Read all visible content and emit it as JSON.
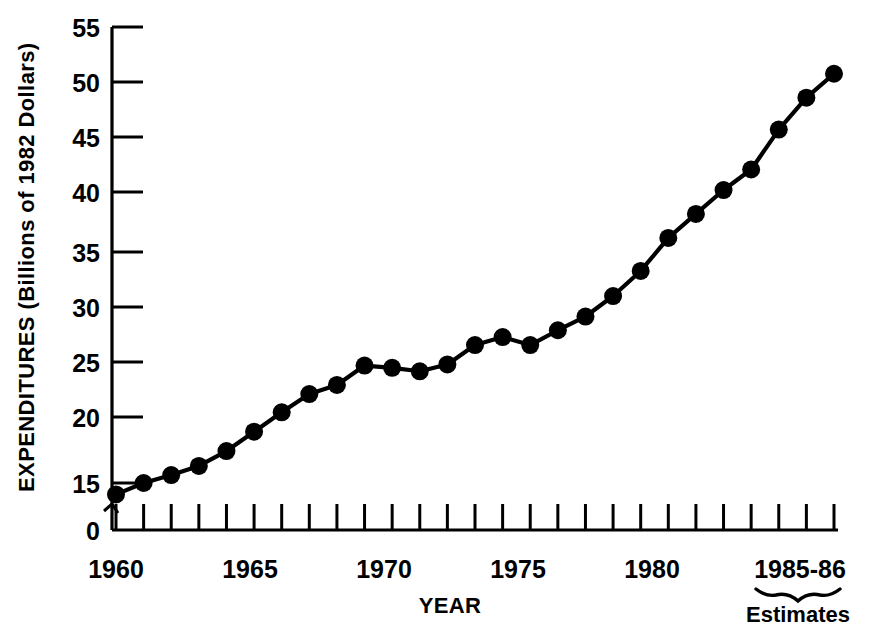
{
  "chart_data": {
    "type": "line",
    "title": "",
    "xlabel": "YEAR",
    "ylabel": "EXPENDITURES (Billions of 1982 Dollars)",
    "x": [
      1960,
      1961,
      1962,
      1963,
      1964,
      1965,
      1966,
      1967,
      1968,
      1969,
      1970,
      1971,
      1972,
      1973,
      1974,
      1975,
      1976,
      1977,
      1978,
      1979,
      1980,
      1981,
      1982,
      1983,
      1984,
      1985,
      1986
    ],
    "values": [
      14.0,
      15.0,
      15.7,
      16.5,
      17.8,
      19.5,
      21.2,
      22.8,
      23.6,
      25.3,
      25.1,
      24.8,
      25.4,
      27.1,
      27.8,
      27.1,
      28.4,
      29.6,
      31.4,
      33.6,
      36.5,
      38.6,
      40.7,
      42.5,
      46.0,
      48.8,
      50.9
    ],
    "ylim": [
      0,
      55
    ],
    "xlim": [
      1960,
      1986
    ],
    "y_ticks": [
      "0",
      "15",
      "20",
      "25",
      "30",
      "35",
      "40",
      "45",
      "50",
      "55"
    ],
    "y_tick_values": [
      0,
      15,
      20,
      25,
      30,
      35,
      40,
      45,
      50,
      55
    ],
    "x_tick_labels": [
      {
        "year": 1960,
        "label": "1960"
      },
      {
        "year": 1965,
        "label": "1965"
      },
      {
        "year": 1970,
        "label": "1970"
      },
      {
        "year": 1975,
        "label": "1975"
      },
      {
        "year": 1980,
        "label": "1980"
      },
      {
        "year": 1985,
        "label": "1985-86"
      }
    ],
    "axis_break": true,
    "axis_break_note": "y-axis broken between 0 and 15",
    "grid": false,
    "legend": "none",
    "annotations": [
      {
        "name": "estimates-note",
        "text": "Estimates",
        "applies_to": "1985-86"
      }
    ],
    "series_color": "#000000",
    "background_color": "#ffffff"
  },
  "axes": {
    "y_title": "EXPENDITURES (Billions of 1982 Dollars)",
    "x_title": "YEAR"
  },
  "notes": {
    "estimates_label": "Estimates"
  }
}
